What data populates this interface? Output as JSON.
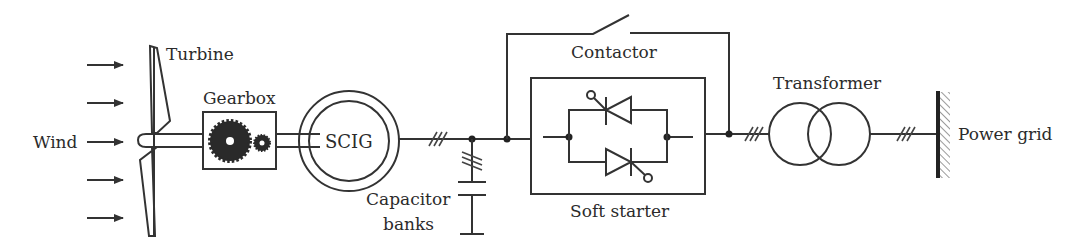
{
  "diagram": {
    "type": "wind-turbine-scig-system",
    "labels": {
      "wind": "Wind",
      "turbine": "Turbine",
      "gearbox": "Gearbox",
      "generator": "SCIG",
      "capacitor_line1": "Capacitor",
      "capacitor_line2": "banks",
      "contactor": "Contactor",
      "soft_starter": "Soft starter",
      "transformer": "Transformer",
      "power_grid": "Power grid"
    },
    "wind_arrows": 5,
    "three_phase_markers": 4,
    "colors": {
      "line": "#333333",
      "text": "#2b2b2b",
      "background": "#ffffff"
    }
  }
}
